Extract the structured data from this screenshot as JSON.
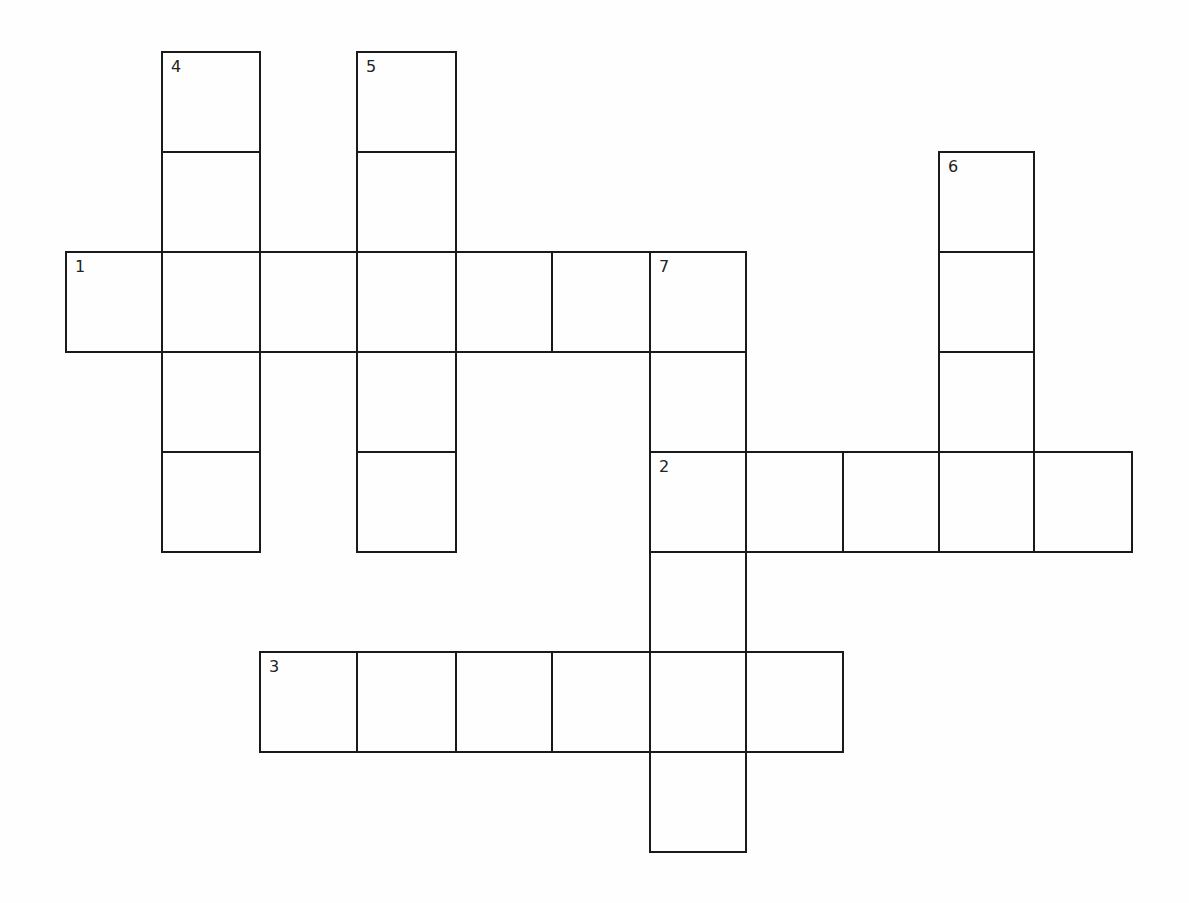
{
  "puzzle": {
    "type": "crossword",
    "grid": {
      "col_x": [
        66,
        162,
        260,
        357,
        456,
        552,
        650,
        746,
        843,
        939,
        1034,
        1132
      ],
      "row_y": [
        52,
        152,
        252,
        352,
        452,
        552,
        652,
        752,
        852
      ],
      "line_color": "#1a1a1a",
      "background": "#fefefe"
    },
    "entries": [
      {
        "number": "1",
        "direction": "across",
        "row": 2,
        "col": 0,
        "length": 7
      },
      {
        "number": "2",
        "direction": "across",
        "row": 4,
        "col": 6,
        "length": 5
      },
      {
        "number": "3",
        "direction": "across",
        "row": 6,
        "col": 2,
        "length": 6
      },
      {
        "number": "4",
        "direction": "down",
        "row": 0,
        "col": 1,
        "length": 5
      },
      {
        "number": "5",
        "direction": "down",
        "row": 0,
        "col": 3,
        "length": 5
      },
      {
        "number": "6",
        "direction": "down",
        "row": 1,
        "col": 9,
        "length": 4
      },
      {
        "number": "7",
        "direction": "down",
        "row": 2,
        "col": 6,
        "length": 6
      }
    ],
    "letters": {}
  }
}
